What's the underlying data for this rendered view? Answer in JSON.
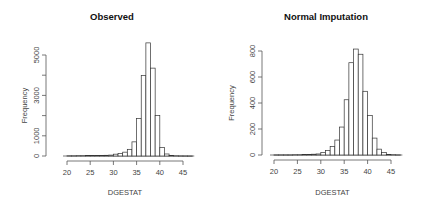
{
  "chart_data": [
    {
      "type": "bar",
      "subtype": "histogram",
      "title": "Observed",
      "xlabel": "DGESTAT",
      "ylabel": "Frequency",
      "xlim": [
        20,
        47
      ],
      "ylim": [
        0,
        5600
      ],
      "x_ticks": [
        20,
        25,
        30,
        35,
        40,
        45
      ],
      "y_ticks": [
        0,
        1000,
        2000,
        3000,
        4000,
        5000
      ],
      "y_tick_labels": [
        "0",
        "1000",
        "",
        "3000",
        "",
        "5000"
      ],
      "grid": false,
      "bin_width": 1,
      "bins": [
        {
          "x0": 20,
          "count": 10
        },
        {
          "x0": 21,
          "count": 10
        },
        {
          "x0": 22,
          "count": 15
        },
        {
          "x0": 23,
          "count": 15
        },
        {
          "x0": 24,
          "count": 20
        },
        {
          "x0": 25,
          "count": 20
        },
        {
          "x0": 26,
          "count": 25
        },
        {
          "x0": 27,
          "count": 30
        },
        {
          "x0": 28,
          "count": 35
        },
        {
          "x0": 29,
          "count": 45
        },
        {
          "x0": 30,
          "count": 90
        },
        {
          "x0": 31,
          "count": 130
        },
        {
          "x0": 32,
          "count": 190
        },
        {
          "x0": 33,
          "count": 330
        },
        {
          "x0": 34,
          "count": 700
        },
        {
          "x0": 35,
          "count": 1850
        },
        {
          "x0": 36,
          "count": 3980
        },
        {
          "x0": 37,
          "count": 5600
        },
        {
          "x0": 38,
          "count": 4350
        },
        {
          "x0": 39,
          "count": 2000
        },
        {
          "x0": 40,
          "count": 420
        },
        {
          "x0": 41,
          "count": 100
        },
        {
          "x0": 42,
          "count": 20
        },
        {
          "x0": 43,
          "count": 10
        },
        {
          "x0": 44,
          "count": 5
        },
        {
          "x0": 45,
          "count": 3
        },
        {
          "x0": 46,
          "count": 2
        }
      ]
    },
    {
      "type": "bar",
      "subtype": "histogram",
      "title": "Normal Imputation",
      "xlabel": "DGESTAT",
      "ylabel": "Frequency",
      "xlim": [
        20,
        47
      ],
      "ylim": [
        0,
        820
      ],
      "x_ticks": [
        20,
        25,
        30,
        35,
        40,
        45
      ],
      "y_ticks": [
        0,
        200,
        400,
        600,
        800
      ],
      "y_tick_labels": [
        "0",
        "200",
        "400",
        "600",
        "800"
      ],
      "grid": false,
      "bin_width": 1,
      "bins": [
        {
          "x0": 20,
          "count": 1
        },
        {
          "x0": 21,
          "count": 1
        },
        {
          "x0": 22,
          "count": 1
        },
        {
          "x0": 23,
          "count": 1
        },
        {
          "x0": 24,
          "count": 2
        },
        {
          "x0": 25,
          "count": 2
        },
        {
          "x0": 26,
          "count": 3
        },
        {
          "x0": 27,
          "count": 4
        },
        {
          "x0": 28,
          "count": 6
        },
        {
          "x0": 29,
          "count": 8
        },
        {
          "x0": 30,
          "count": 20
        },
        {
          "x0": 31,
          "count": 35
        },
        {
          "x0": 32,
          "count": 65
        },
        {
          "x0": 33,
          "count": 115
        },
        {
          "x0": 34,
          "count": 215
        },
        {
          "x0": 35,
          "count": 425
        },
        {
          "x0": 36,
          "count": 710
        },
        {
          "x0": 37,
          "count": 815
        },
        {
          "x0": 38,
          "count": 775
        },
        {
          "x0": 39,
          "count": 490
        },
        {
          "x0": 40,
          "count": 305
        },
        {
          "x0": 41,
          "count": 130
        },
        {
          "x0": 42,
          "count": 45
        },
        {
          "x0": 43,
          "count": 20
        },
        {
          "x0": 44,
          "count": 5
        },
        {
          "x0": 45,
          "count": 2
        },
        {
          "x0": 46,
          "count": 1
        }
      ]
    }
  ],
  "panels": [
    {
      "title": "Observed",
      "xlabel": "DGESTAT",
      "ylabel": "Frequency"
    },
    {
      "title": "Normal Imputation",
      "xlabel": "DGESTAT",
      "ylabel": "Frequency"
    }
  ],
  "layout": {
    "panels": [
      {
        "x_px_20": 67,
        "x_px_45": 183,
        "y_px_zero": 156,
        "y_px_top_value": 5000,
        "y_px_top": 55,
        "axis_y": 161,
        "yaxis_x": 46,
        "title_x": 112,
        "title_y": 20,
        "xlabel_y": 195,
        "ylabel_x": 27
      },
      {
        "x_px_20": 274,
        "x_px_45": 391,
        "y_px_zero": 155,
        "y_px_top_value": 800,
        "y_px_top": 51,
        "axis_y": 160,
        "yaxis_x": 262,
        "title_x": 326,
        "title_y": 20,
        "xlabel_y": 195,
        "ylabel_x": 234
      }
    ]
  }
}
